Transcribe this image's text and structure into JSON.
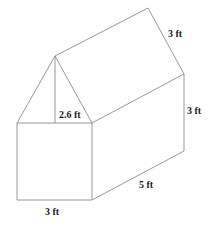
{
  "figure": {
    "shape": "triangular-prism-on-rectangular-prism (house shape)",
    "labels": {
      "roof_slant": "3 ft",
      "wall_height": "3 ft",
      "length": "5 ft",
      "width": "3 ft",
      "triangle_height": "2.6 ft"
    },
    "colors": {
      "edge": "#8c8c8c",
      "text": "#1a1a1a",
      "background": "#ffffff"
    }
  }
}
